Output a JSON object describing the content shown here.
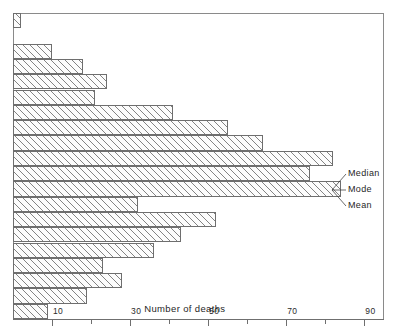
{
  "chart_data": {
    "type": "bar",
    "orientation": "horizontal",
    "title": "",
    "xlabel": "Number of deaths",
    "ylabel": "",
    "xlim": [
      0,
      95
    ],
    "grid": false,
    "legend": null,
    "tick_labels": [
      "10",
      "30",
      "50",
      "70",
      "90"
    ],
    "tick_values": [
      10,
      30,
      50,
      70,
      90
    ],
    "minor_tick_values": [
      20,
      40,
      60,
      80
    ],
    "categories": [
      "class-1",
      "class-2",
      "class-3",
      "class-4",
      "class-5",
      "class-6",
      "class-7",
      "class-8",
      "class-9",
      "class-10",
      "class-11",
      "class-12",
      "class-13",
      "class-14",
      "class-15",
      "class-16",
      "class-17",
      "class-18",
      "class-19",
      "class-20"
    ],
    "values": [
      2,
      0,
      10,
      18,
      24,
      21,
      41,
      55,
      64,
      82,
      76,
      84,
      32,
      52,
      43,
      36,
      23,
      28,
      19,
      9
    ],
    "annotations": [
      {
        "label": "Median",
        "target_value": 84,
        "target_row": 9
      },
      {
        "label": "Mode",
        "target_value": 84,
        "target_row": 11
      },
      {
        "label": "Mean",
        "target_value": 84,
        "target_row": 11
      }
    ]
  },
  "axis": {
    "x_title": "Number of deaths",
    "labels": [
      "10",
      "30",
      "50",
      "70",
      "90"
    ]
  },
  "annotations": {
    "median": "Median",
    "mode": "Mode",
    "mean": "Mean"
  },
  "colors": {
    "bar_fill": "#fcfcfc",
    "bar_hatch": "#6e6e6e",
    "bar_edge": "#6e6e6e",
    "axis": "#8a8a8a",
    "text": "#1f1f1f"
  }
}
